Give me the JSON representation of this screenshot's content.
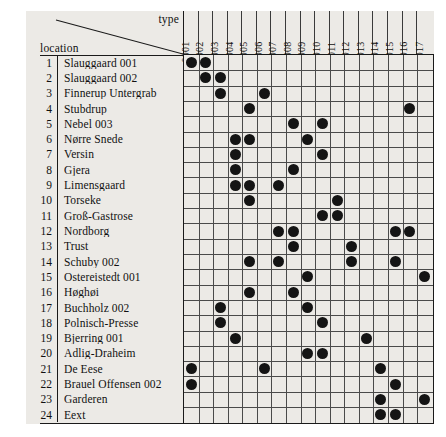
{
  "figure": {
    "corner": {
      "type_label": "type",
      "location_label": "location"
    }
  },
  "chart_data": {
    "type": "heatmap",
    "title": "",
    "xlabel": "type",
    "ylabel": "location",
    "grid": true,
    "legend": null,
    "notation": "filled dot marks an occurrence of the column type at the row location",
    "categories": [
      "0001",
      "0002",
      "0003",
      "0004",
      "0005",
      "0006",
      "0007",
      "0008",
      "0009",
      "0010",
      "0011",
      "0012",
      "0013",
      "0014",
      "0015",
      "0016",
      "0017"
    ],
    "row_numbers": [
      1,
      2,
      3,
      4,
      5,
      6,
      7,
      8,
      9,
      10,
      11,
      12,
      13,
      14,
      15,
      16,
      17,
      18,
      19,
      20,
      21,
      22,
      23,
      24
    ],
    "rows": [
      {
        "num": 1,
        "label": "Slauggaard 001",
        "marks": [
          1,
          2
        ]
      },
      {
        "num": 2,
        "label": "Slauggaard 002",
        "marks": [
          2,
          3
        ]
      },
      {
        "num": 3,
        "label": "Finnerup Untergrab",
        "marks": [
          3,
          6
        ]
      },
      {
        "num": 4,
        "label": "Stubdrup",
        "marks": [
          5,
          16
        ]
      },
      {
        "num": 5,
        "label": "Nebel 003",
        "marks": [
          8,
          10
        ]
      },
      {
        "num": 6,
        "label": "Nørre Snede",
        "marks": [
          4,
          5,
          9
        ]
      },
      {
        "num": 7,
        "label": "Versin",
        "marks": [
          4,
          10
        ]
      },
      {
        "num": 8,
        "label": "Gjera",
        "marks": [
          4,
          8
        ]
      },
      {
        "num": 9,
        "label": "Limensgaard",
        "marks": [
          4,
          5,
          7
        ]
      },
      {
        "num": 10,
        "label": "Torseke",
        "marks": [
          5,
          11
        ]
      },
      {
        "num": 11,
        "label": "Groß-Gastrose",
        "marks": [
          10,
          11
        ]
      },
      {
        "num": 12,
        "label": "Nordborg",
        "marks": [
          7,
          8,
          15,
          16
        ]
      },
      {
        "num": 13,
        "label": "Trust",
        "marks": [
          8,
          12
        ]
      },
      {
        "num": 14,
        "label": "Schuby 002",
        "marks": [
          5,
          7,
          12,
          15
        ]
      },
      {
        "num": 15,
        "label": "Ostereistedt 001",
        "marks": [
          9,
          17
        ]
      },
      {
        "num": 16,
        "label": "Høghøi",
        "marks": [
          5,
          8
        ]
      },
      {
        "num": 17,
        "label": "Buchholz 002",
        "marks": [
          3,
          9
        ]
      },
      {
        "num": 18,
        "label": "Polnisch-Presse",
        "marks": [
          3,
          10
        ]
      },
      {
        "num": 19,
        "label": "Bjerring 001",
        "marks": [
          4,
          13
        ]
      },
      {
        "num": 20,
        "label": "Adlig-Draheim",
        "marks": [
          9,
          10
        ]
      },
      {
        "num": 21,
        "label": "De Eese",
        "marks": [
          1,
          6,
          14
        ]
      },
      {
        "num": 22,
        "label": "Brauel Offensen 002",
        "marks": [
          1,
          15
        ]
      },
      {
        "num": 23,
        "label": "Garderen",
        "marks": [
          14,
          17
        ]
      },
      {
        "num": 24,
        "label": "Eext",
        "marks": [
          14,
          15
        ]
      }
    ]
  }
}
